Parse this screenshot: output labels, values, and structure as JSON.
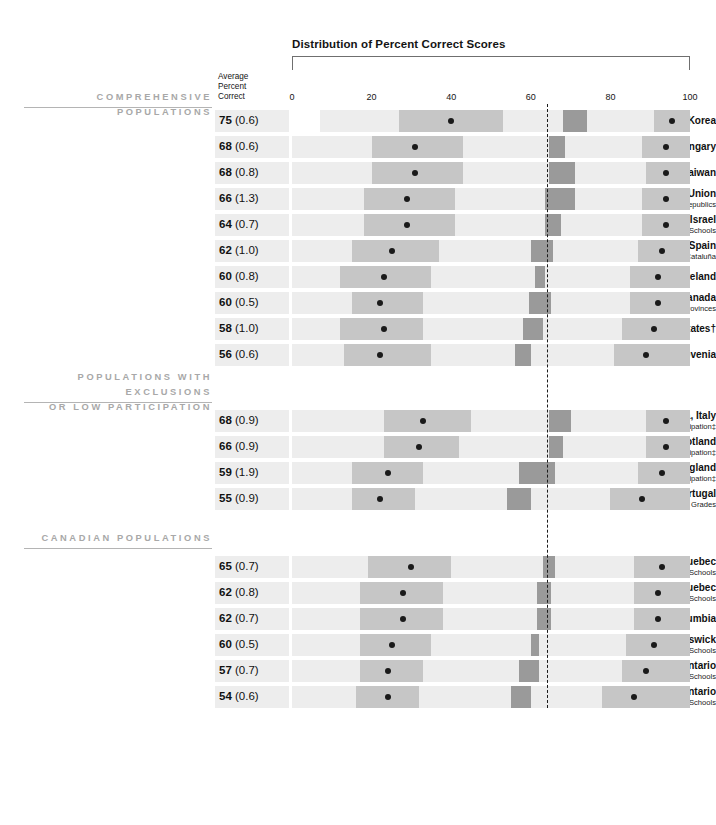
{
  "title": "Distribution of Percent Correct Scores",
  "avg_header": "Average\nPercent\nCorrect",
  "axis": {
    "ticks": [
      0,
      20,
      40,
      60,
      80,
      100
    ],
    "tick_labels": [
      "0",
      "20",
      "40",
      "60",
      "80",
      "100"
    ],
    "min": 0,
    "max": 100
  },
  "reference_line_value": 64,
  "colors": {
    "band": "#ededed",
    "box_mid": "#c6c6c6",
    "box_dark": "#9a9a9a",
    "dot": "#1a1a1a",
    "section_head": "#a8a8a8",
    "rule": "#b4b4b4"
  },
  "chart_data": {
    "type": "bar",
    "title": "Distribution of Percent Correct Scores",
    "xlabel": "",
    "ylabel": "",
    "xlim": [
      0,
      100
    ],
    "grid": false,
    "legend": "none",
    "reference_line": 64,
    "columns": [
      "Population",
      "Average Percent Correct",
      "Standard Error",
      "5th percentile",
      "25th percentile",
      "75th percentile",
      "95th percentile"
    ],
    "sections": [
      {
        "header": "COMPREHENSIVE POPULATIONS",
        "rows": [
          {
            "name": "Korea",
            "sub": "",
            "mean": "75",
            "se": "(0.6)",
            "mean_value": 75,
            "p5": 27,
            "p25": 42,
            "p75": 71,
            "p95": 95,
            "band_start": 7,
            "band_end": 100,
            "dark_start": 68,
            "dark_end": 74,
            "right_start": 91,
            "right_end": 100
          },
          {
            "name": "Hungary",
            "sub": "",
            "mean": "68",
            "se": "(0.6)",
            "mean_value": 68,
            "p5": 20,
            "p25": 34,
            "p75": 66,
            "p95": 91,
            "band_start": 0,
            "band_end": 100,
            "dark_start": 65,
            "dark_end": 69,
            "right_start": 88,
            "right_end": 100
          },
          {
            "name": "Taiwan",
            "sub": "",
            "mean": "68",
            "se": "(0.8)",
            "mean_value": 68,
            "p5": 20,
            "p25": 33,
            "p75": 66,
            "p95": 92,
            "band_start": 0,
            "band_end": 100,
            "dark_start": 65,
            "dark_end": 71,
            "right_start": 89,
            "right_end": 100
          },
          {
            "name": "Soviet Union",
            "sub": "Russian-speaking Schools in 14 Republics",
            "mean": "66",
            "se": "(1.3)",
            "mean_value": 66,
            "p5": 18,
            "p25": 31,
            "p75": 64,
            "p95": 91,
            "band_start": 0,
            "band_end": 100,
            "dark_start": 63,
            "dark_end": 71,
            "right_start": 88,
            "right_end": 100
          },
          {
            "name": "Israel",
            "sub": "Hebrew-speaking Schools",
            "mean": "64",
            "se": "(0.7)",
            "mean_value": 64,
            "p5": 18,
            "p25": 31,
            "p75": 64,
            "p95": 91,
            "band_start": 0,
            "band_end": 100,
            "dark_start": 63,
            "dark_end": 67,
            "right_start": 88,
            "right_end": 100
          },
          {
            "name": "Spain",
            "sub": "Spanish-speaking Schools except in Cataluña",
            "mean": "62",
            "se": "(1.0)",
            "mean_value": 62,
            "p5": 14,
            "p25": 28,
            "p75": 62,
            "p95": 90,
            "band_start": 0,
            "band_end": 100,
            "dark_start": 60,
            "dark_end": 65,
            "right_start": 87,
            "right_end": 100
          },
          {
            "name": "Ireland",
            "sub": "",
            "mean": "60",
            "se": "(0.8)",
            "mean_value": 60,
            "p5": 12,
            "p25": 25,
            "p75": 59,
            "p95": 88,
            "band_start": 0,
            "band_end": 100,
            "dark_start": 58,
            "dark_end": 63,
            "right_start": 85,
            "right_end": 100
          },
          {
            "name": "Canada",
            "sub": "4 Provinces",
            "mean": "60",
            "se": "(0.5)",
            "mean_value": 60,
            "p5": 15,
            "p25": 28,
            "p75": 59,
            "p95": 88,
            "band_start": 0,
            "band_end": 100,
            "dark_start": 61,
            "dark_end": 63,
            "right_start": 85,
            "right_end": 100
          },
          {
            "name": "Israel2",
            "sub": "",
            "mean": "58",
            "se": "(1.0)",
            "mean_value": 58,
            "p5": 12,
            "p25": 25,
            "p75": 57,
            "p95": 87,
            "band_start": 0,
            "band_end": 100,
            "dark_start": 59,
            "dark_end": 64,
            "right_start": 84,
            "right_end": 100
          },
          {
            "name": "Slovenia",
            "sub": "",
            "mean": "56",
            "se": "(0.6)",
            "mean_value": 56,
            "p5": 14,
            "p25": 27,
            "p75": 56,
            "p95": 85,
            "band_start": 0,
            "band_end": 100,
            "dark_start": 56,
            "dark_end": 61,
            "right_start": 81,
            "right_end": 100
          }
        ]
      }
    ]
  },
  "sections": [
    {
      "id": "comprehensive",
      "header": "COMPREHENSIVE POPULATIONS",
      "rows": [
        {
          "name": "Korea",
          "sub": "",
          "mean": "75",
          "se": "(0.6)",
          "band": [
            7,
            100
          ],
          "mid": [
            27,
            53
          ],
          "dot": 40,
          "dark": [
            68,
            74
          ],
          "right": [
            91,
            100
          ],
          "rdot": 95.5
        },
        {
          "name": "Hungary",
          "sub": "",
          "mean": "68",
          "se": "(0.6)",
          "band": [
            0,
            100
          ],
          "mid": [
            20,
            43
          ],
          "dot": 31,
          "dark": [
            64.5,
            68.5
          ],
          "right": [
            88,
            100
          ],
          "rdot": 94
        },
        {
          "name": "Taiwan",
          "sub": "",
          "mean": "68",
          "se": "(0.8)",
          "band": [
            0,
            100
          ],
          "mid": [
            20,
            43
          ],
          "dot": 31,
          "dark": [
            64.5,
            71
          ],
          "right": [
            89,
            100
          ],
          "rdot": 94
        },
        {
          "name": "Soviet Union",
          "sub": "Russian-speaking Schools in 14 Republics",
          "mean": "66",
          "se": "(1.3)",
          "band": [
            0,
            100
          ],
          "mid": [
            18,
            41
          ],
          "dot": 29,
          "dark": [
            63.5,
            71
          ],
          "right": [
            88,
            100
          ],
          "rdot": 94
        },
        {
          "name": "Israel",
          "sub": "Hebrew-speaking Schools",
          "mean": "64",
          "se": "(0.7)",
          "band": [
            0,
            100
          ],
          "mid": [
            18,
            41
          ],
          "dot": 29,
          "dark": [
            63.5,
            67.5
          ],
          "right": [
            88,
            100
          ],
          "rdot": 94
        },
        {
          "name": "Spain",
          "sub": "Spanish-speaking Schools except in Cataluña",
          "mean": "62",
          "se": "(1.0)",
          "band": [
            0,
            100
          ],
          "mid": [
            15,
            37
          ],
          "dot": 25,
          "dark": [
            60,
            65.5
          ],
          "right": [
            87,
            100
          ],
          "rdot": 93
        },
        {
          "name": "Ireland",
          "sub": "",
          "mean": "60",
          "se": "(0.8)",
          "band": [
            0,
            100
          ],
          "mid": [
            12,
            35
          ],
          "dot": 23,
          "dark": [
            61,
            63.5
          ],
          "right": [
            85,
            100
          ],
          "rdot": 92
        },
        {
          "name": "Canada",
          "sub": "4 Provinces",
          "mean": "60",
          "se": "(0.5)",
          "band": [
            0,
            100
          ],
          "mid": [
            15,
            33
          ],
          "dot": 22,
          "dark": [
            59.5,
            65
          ],
          "right": [
            85,
            100
          ],
          "rdot": 92
        },
        {
          "name": "United States†",
          "sub": "",
          "mean": "58",
          "se": "(1.0)",
          "band": [
            0,
            100
          ],
          "mid": [
            12,
            33
          ],
          "dot": 23,
          "dark": [
            58,
            63
          ],
          "right": [
            83,
            100
          ],
          "rdot": 91
        },
        {
          "name": "Slovenia",
          "sub": "",
          "mean": "56",
          "se": "(0.6)",
          "band": [
            0,
            100
          ],
          "mid": [
            13,
            35
          ],
          "dot": 22,
          "dark": [
            56,
            60
          ],
          "right": [
            81,
            100
          ],
          "rdot": 89
        }
      ]
    },
    {
      "id": "exclusions",
      "header": "POPULATIONS WITH EXCLUSIONS\nOR LOW PARTICIPATION",
      "rows": [
        {
          "name": "Emilia-Romagna, Italy",
          "sub": "Low Participation‡",
          "mean": "68",
          "se": "(0.9)",
          "band": [
            0,
            100
          ],
          "mid": [
            23,
            45
          ],
          "dot": 33,
          "dark": [
            64.5,
            70
          ],
          "right": [
            89,
            100
          ],
          "rdot": 94
        },
        {
          "name": "Scotland",
          "sub": "Low Participation‡",
          "mean": "66",
          "se": "(0.9)",
          "band": [
            0,
            100
          ],
          "mid": [
            23,
            42
          ],
          "dot": 32,
          "dark": [
            64.5,
            68
          ],
          "right": [
            89,
            100
          ],
          "rdot": 94
        },
        {
          "name": "England",
          "sub": "Low Participation‡",
          "mean": "59",
          "se": "(1.9)",
          "band": [
            0,
            100
          ],
          "mid": [
            15,
            33
          ],
          "dot": 24,
          "dark": [
            57,
            66
          ],
          "right": [
            87,
            100
          ],
          "rdot": 93
        },
        {
          "name": "Portugal",
          "sub": "Restricted Grades",
          "mean": "55",
          "se": "(0.9)",
          "band": [
            0,
            100
          ],
          "mid": [
            15,
            31
          ],
          "dot": 22,
          "dark": [
            54,
            60
          ],
          "right": [
            80,
            100
          ],
          "rdot": 88
        }
      ]
    },
    {
      "id": "canadian",
      "header": "CANADIAN POPULATIONS",
      "rows": [
        {
          "name": "Quebec",
          "sub": "French-speaking Schools",
          "mean": "65",
          "se": "(0.7)",
          "band": [
            0,
            100
          ],
          "mid": [
            19,
            40
          ],
          "dot": 30,
          "dark": [
            63,
            66
          ],
          "right": [
            86,
            100
          ],
          "rdot": 93
        },
        {
          "name": "Quebec",
          "sub": "English-speaking Schools",
          "mean": "62",
          "se": "(0.8)",
          "band": [
            0,
            100
          ],
          "mid": [
            17,
            38
          ],
          "dot": 28,
          "dark": [
            61.5,
            65
          ],
          "right": [
            86,
            100
          ],
          "rdot": 92
        },
        {
          "name": "British Columbia",
          "sub": "",
          "mean": "62",
          "se": "(0.7)",
          "band": [
            0,
            100
          ],
          "mid": [
            17,
            38
          ],
          "dot": 28,
          "dark": [
            61.5,
            65
          ],
          "right": [
            86,
            100
          ],
          "rdot": 92
        },
        {
          "name": "New Brunswick",
          "sub": "English-speaking Schools",
          "mean": "60",
          "se": "(0.5)",
          "band": [
            0,
            100
          ],
          "mid": [
            17,
            35
          ],
          "dot": 25,
          "dark": [
            60,
            62
          ],
          "right": [
            84,
            100
          ],
          "rdot": 91
        },
        {
          "name": "Ontario",
          "sub": "English-speaking Schools",
          "mean": "57",
          "se": "(0.7)",
          "band": [
            0,
            100
          ],
          "mid": [
            17,
            33
          ],
          "dot": 24,
          "dark": [
            57,
            62
          ],
          "right": [
            83,
            100
          ],
          "rdot": 89
        },
        {
          "name": "Ontario",
          "sub": "French-speaking Schools",
          "mean": "54",
          "se": "(0.6)",
          "band": [
            0,
            100
          ],
          "mid": [
            16,
            32
          ],
          "dot": 24,
          "dark": [
            55,
            60
          ],
          "right": [
            78,
            100
          ],
          "rdot": 86
        }
      ]
    }
  ]
}
